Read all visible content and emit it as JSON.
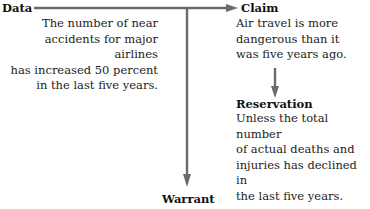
{
  "diagram": {
    "type": "Toulmin argument model",
    "colors": {
      "arrow": "#6b6b6b",
      "text": "#222222"
    },
    "data": {
      "label": "Data",
      "text": "The number of near accidents for major airlines has increased 50 percent in the last five years.",
      "lines": [
        "The number of near",
        "accidents for major airlines",
        "has increased 50 percent",
        "in the last five years."
      ]
    },
    "claim": {
      "label": "Claim",
      "text": "Air travel is more dangerous than it was five years ago.",
      "lines": [
        "Air travel is more",
        "dangerous than it",
        "was five years ago."
      ]
    },
    "reservation": {
      "label": "Reservation",
      "text": "Unless the total number of actual deaths and injuries has declined in the last five years.",
      "lines": [
        "Unless the total number",
        "of actual deaths and",
        "injuries has declined in",
        "the last five years."
      ]
    },
    "warrant": {
      "label": "Warrant"
    },
    "connections": [
      {
        "from": "Data",
        "to": "Claim",
        "direction": "right"
      },
      {
        "from": "Data",
        "to": "Warrant",
        "direction": "down"
      },
      {
        "from": "Claim",
        "to": "Reservation",
        "direction": "down"
      }
    ]
  }
}
